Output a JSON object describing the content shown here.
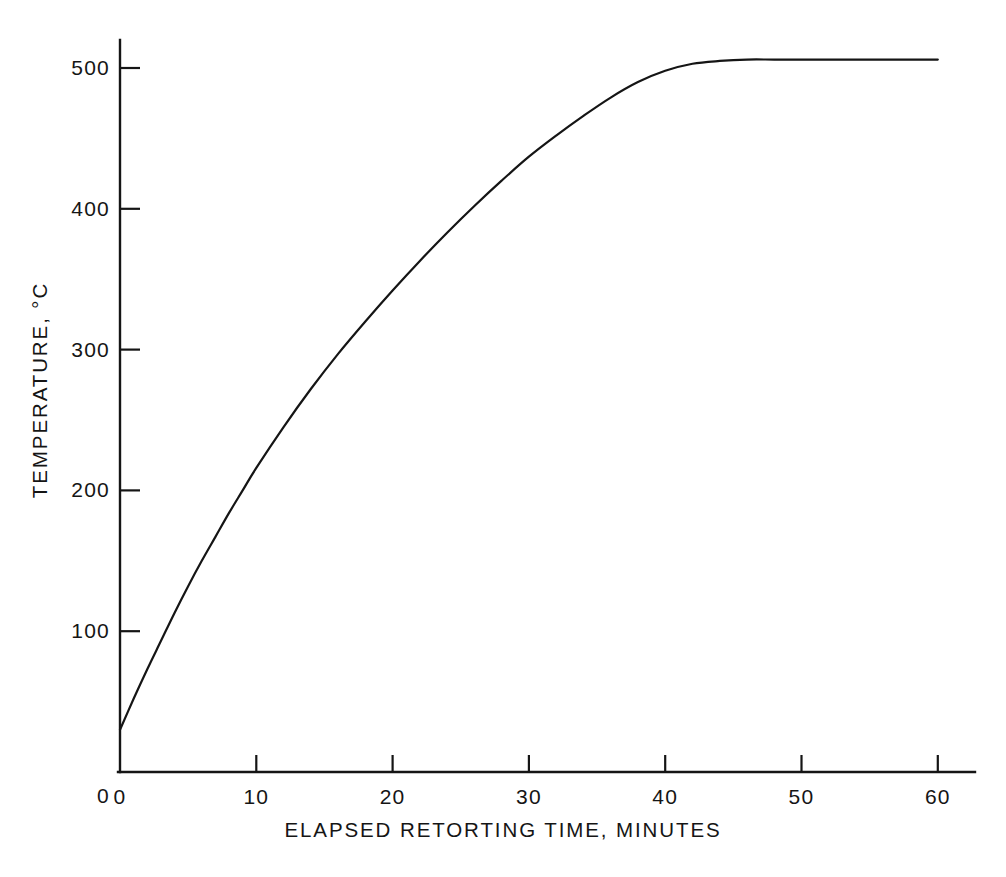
{
  "chart_data": {
    "type": "line",
    "title": "",
    "subtitle": "",
    "xlabel": "ELAPSED RETORTING TIME, MINUTES",
    "ylabel": "TEMPERATURE, °C",
    "xlim": [
      0,
      62
    ],
    "ylim": [
      0,
      520
    ],
    "xticks": [
      0,
      10,
      20,
      30,
      40,
      50,
      60
    ],
    "xtick_labels": [
      "0",
      "10",
      "20",
      "30",
      "40",
      "50",
      "60"
    ],
    "yticks": [
      0,
      100,
      200,
      300,
      400,
      500
    ],
    "ytick_labels": [
      "0",
      "100",
      "200",
      "300",
      "400",
      "500"
    ],
    "grid": false,
    "legend": null,
    "legend_position": "none",
    "annotations": [],
    "line_color": "#151515",
    "axis_color": "#151515",
    "background_color": "#ffffff",
    "series": [
      {
        "name": "Retort temperature",
        "x": [
          0,
          1,
          2,
          3,
          4,
          5,
          6,
          7,
          8,
          9,
          10,
          12,
          14,
          16,
          18,
          20,
          22,
          24,
          26,
          28,
          30,
          32,
          34,
          36,
          38,
          40,
          42,
          44,
          46,
          48,
          50,
          52,
          54,
          56,
          58,
          60
        ],
        "values": [
          30,
          52,
          73,
          93,
          113,
          132,
          150,
          167,
          184,
          200,
          216,
          245,
          272,
          297,
          320,
          342,
          363,
          383,
          402,
          420,
          437,
          452,
          466,
          479,
          490,
          498,
          503,
          505,
          506,
          506,
          506,
          506,
          506,
          506,
          506,
          506
        ]
      }
    ]
  },
  "axes_geometry": {
    "origin_x_px": 120,
    "origin_y_px": 772,
    "x_px_per_unit": 13.63,
    "y_px_per_unit": 1.408,
    "x_axis_end_px": 975,
    "y_axis_top_px": 40
  },
  "labels": {
    "x_title_top_px": 818,
    "y_title_center_x_px": 40,
    "y_title_center_y_px": 390
  }
}
